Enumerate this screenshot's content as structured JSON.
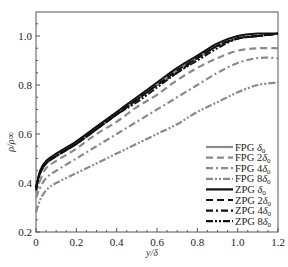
{
  "chart_data": {
    "type": "line",
    "title": "",
    "xlabel": "y/δ",
    "ylabel": "ρ/ρ∞",
    "xlim": [
      0,
      1.2
    ],
    "ylim": [
      0.2,
      1.1
    ],
    "xticks": [
      0,
      0.2,
      0.4,
      0.6,
      0.8,
      1.0,
      1.2
    ],
    "xtick_labels": [
      "0",
      "0.2",
      "0.4",
      "0.6",
      "0.8",
      "1.0",
      "1.2"
    ],
    "yticks": [
      0.2,
      0.4,
      0.6,
      0.8,
      1.0
    ],
    "ytick_labels": [
      "0.2",
      "0.4",
      "0.6",
      "0.8",
      "1.0"
    ],
    "grid": false,
    "legend_position": "lower right",
    "x": [
      0,
      0.02,
      0.05,
      0.1,
      0.2,
      0.3,
      0.4,
      0.5,
      0.6,
      0.7,
      0.8,
      0.9,
      1.0,
      1.1,
      1.2
    ],
    "series": [
      {
        "name": "FPG δ0",
        "style": "solid",
        "color": "#8a8a8a",
        "values": [
          0.38,
          0.44,
          0.48,
          0.51,
          0.56,
          0.62,
          0.68,
          0.74,
          0.8,
          0.86,
          0.91,
          0.96,
          0.99,
          1.0,
          1.01
        ]
      },
      {
        "name": "FPG 2δ0",
        "style": "dash",
        "color": "#8a8a8a",
        "values": [
          0.36,
          0.41,
          0.46,
          0.49,
          0.54,
          0.6,
          0.65,
          0.71,
          0.76,
          0.82,
          0.87,
          0.91,
          0.94,
          0.95,
          0.95
        ]
      },
      {
        "name": "FPG 4δ0",
        "style": "dashdot",
        "color": "#8a8a8a",
        "values": [
          0.34,
          0.38,
          0.42,
          0.45,
          0.5,
          0.55,
          0.6,
          0.65,
          0.7,
          0.75,
          0.8,
          0.85,
          0.89,
          0.91,
          0.91
        ]
      },
      {
        "name": "FPG 8δ0",
        "style": "dashdotdot",
        "color": "#8a8a8a",
        "values": [
          0.28,
          0.33,
          0.37,
          0.4,
          0.44,
          0.48,
          0.52,
          0.56,
          0.6,
          0.64,
          0.69,
          0.73,
          0.77,
          0.8,
          0.81
        ]
      },
      {
        "name": "ZPG δ0",
        "style": "solid",
        "color": "#111111",
        "values": [
          0.38,
          0.45,
          0.49,
          0.52,
          0.57,
          0.63,
          0.69,
          0.75,
          0.81,
          0.87,
          0.92,
          0.97,
          1.0,
          1.01,
          1.01
        ]
      },
      {
        "name": "ZPG 2δ0",
        "style": "dash",
        "color": "#111111",
        "values": [
          0.38,
          0.44,
          0.48,
          0.51,
          0.56,
          0.62,
          0.68,
          0.74,
          0.8,
          0.86,
          0.91,
          0.96,
          0.99,
          1.0,
          1.01
        ]
      },
      {
        "name": "ZPG 4δ0",
        "style": "dashdot",
        "color": "#111111",
        "values": [
          0.38,
          0.44,
          0.48,
          0.51,
          0.56,
          0.62,
          0.68,
          0.74,
          0.8,
          0.85,
          0.91,
          0.96,
          0.99,
          1.0,
          1.01
        ]
      },
      {
        "name": "ZPG 8δ0",
        "style": "dashdotdot",
        "color": "#111111",
        "values": [
          0.37,
          0.44,
          0.48,
          0.51,
          0.56,
          0.62,
          0.68,
          0.73,
          0.79,
          0.85,
          0.9,
          0.95,
          0.99,
          1.0,
          1.01
        ]
      }
    ]
  },
  "legend": {
    "items": [
      {
        "label": "FPG δ0"
      },
      {
        "label": "FPG 2δ0"
      },
      {
        "label": "FPG 4δ0"
      },
      {
        "label": "FPG 8δ0"
      },
      {
        "label": "ZPG δ0"
      },
      {
        "label": "ZPG 2δ0"
      },
      {
        "label": "ZPG 4δ0"
      },
      {
        "label": "ZPG 8δ0"
      }
    ]
  },
  "axes": {
    "xlabel": "y/δ",
    "ylabel": "ρ/ρ∞"
  }
}
